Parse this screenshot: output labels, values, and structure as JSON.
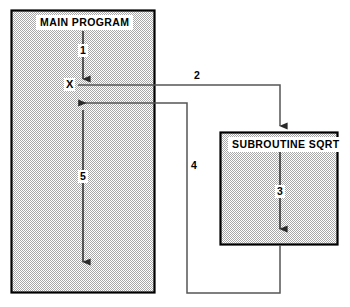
{
  "diagram": {
    "type": "flow-diagram",
    "title_text": "Subroutine call and return flow",
    "colors": {
      "box_fill": "#c9c9c9",
      "box_border": "#000000",
      "line": "#333333",
      "label_bg": "#ffffff",
      "text": "#000000",
      "page_bg": "#ffffff"
    },
    "boxes": [
      {
        "id": "main-program",
        "label": "MAIN PROGRAM",
        "x": 11,
        "y": 10,
        "width": 144,
        "height": 283
      },
      {
        "id": "subroutine-sqrt",
        "label": "SUBROUTINE SQRT",
        "x": 220,
        "y": 132,
        "width": 118,
        "height": 113
      }
    ],
    "nodes": [
      {
        "id": "point-x",
        "label": "X",
        "x": 72,
        "y": 85
      }
    ],
    "steps": [
      {
        "id": "step-1",
        "label": "1",
        "description": "main program executes downward to call point X"
      },
      {
        "id": "step-2",
        "label": "2",
        "description": "call transfers control from X to SUBROUTINE SQRT"
      },
      {
        "id": "step-3",
        "label": "3",
        "description": "subroutine SQRT executes downward"
      },
      {
        "id": "step-4",
        "label": "4",
        "description": "return path travels back toward the main program"
      },
      {
        "id": "step-5",
        "label": "5",
        "description": "main program resumes execution after the return"
      }
    ]
  }
}
